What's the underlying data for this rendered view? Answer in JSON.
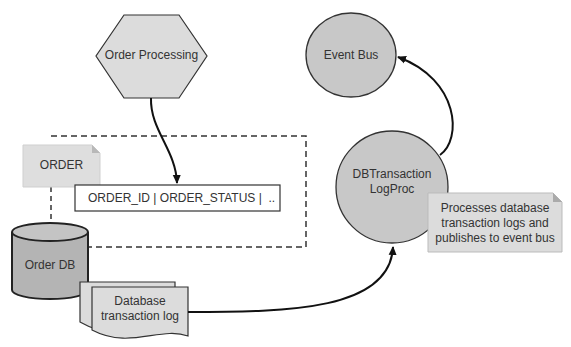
{
  "diagram": {
    "nodes": {
      "order_processing": {
        "label": "Order Processing",
        "shape": "hexagon"
      },
      "event_bus": {
        "label": "Event Bus",
        "shape": "circle"
      },
      "order_note": {
        "label": "ORDER",
        "shape": "note"
      },
      "order_table_row": {
        "label": "ORDER_ID | ORDER_STATUS |  ..",
        "shape": "rectangle"
      },
      "order_db": {
        "label": "Order DB",
        "shape": "cylinder"
      },
      "dbtx_logproc": {
        "line1": "DBTransaction",
        "line2": "LogProc",
        "shape": "circle"
      },
      "processor_note": {
        "line1": "Processes database",
        "line2": "transaction logs and",
        "line3": "publishes to event bus",
        "shape": "note"
      },
      "tx_log": {
        "line1": "Database",
        "line2": "transaction log",
        "shape": "multi-document"
      }
    },
    "edges": [
      {
        "from": "Order Processing",
        "to": "ORDER table row",
        "arrow": true
      },
      {
        "from": "Database transaction log",
        "to": "DBTransaction LogProc",
        "arrow": true
      },
      {
        "from": "DBTransaction LogProc",
        "to": "Event Bus",
        "arrow": true
      },
      {
        "from": "ORDER",
        "to": "Order DB",
        "style": "dashed"
      }
    ],
    "colors": {
      "fill_light": "#dcdcdc",
      "fill_circle": "#c8c8c8",
      "fill_db": "#b4b4b4",
      "stroke": "#333333"
    }
  }
}
